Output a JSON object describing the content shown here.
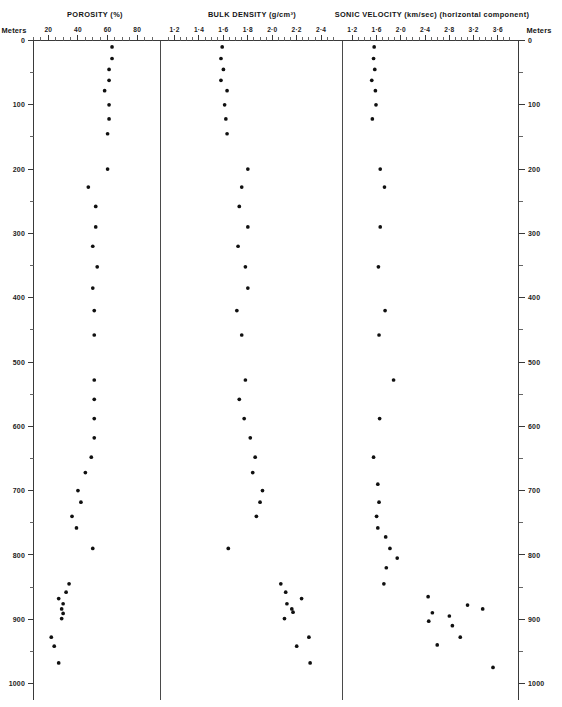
{
  "figure": {
    "width": 562,
    "height": 707,
    "background": "#ffffff",
    "point_color": "#101010",
    "axis_color": "#3a3a3a"
  },
  "depth_axis": {
    "name_left": "Meters",
    "name_right": "Meters",
    "min": 0,
    "max": 1000,
    "major_step": 100,
    "minor_step": 50,
    "labels": [
      "0",
      "100",
      "200",
      "300",
      "400",
      "500",
      "600",
      "700",
      "800",
      "900",
      "1000"
    ]
  },
  "panels": [
    {
      "key": "porosity",
      "title": "POROSITY",
      "units": "(%)",
      "xmin": 10,
      "xmax": 92,
      "tick_step": 5,
      "labeled_ticks": [
        {
          "value": 20,
          "label": "20"
        },
        {
          "value": 40,
          "label": "40"
        },
        {
          "value": 60,
          "label": "60"
        },
        {
          "value": 80,
          "label": "80"
        }
      ]
    },
    {
      "key": "bulk_density",
      "title": "BULK DENSITY",
      "units": "(g/cm³)",
      "xmin": 1.13,
      "xmax": 2.53,
      "tick_step": 0.05,
      "labeled_ticks": [
        {
          "value": 1.2,
          "label": "1·2"
        },
        {
          "value": 1.4,
          "label": "1·4"
        },
        {
          "value": 1.6,
          "label": "1·6"
        },
        {
          "value": 1.8,
          "label": "1·8"
        },
        {
          "value": 2.0,
          "label": "2·0"
        },
        {
          "value": 2.2,
          "label": "2·2"
        },
        {
          "value": 2.4,
          "label": "2·4"
        }
      ]
    },
    {
      "key": "sonic_velocity",
      "title": "SONIC VELOCITY",
      "units": "(km/sec)",
      "note": "(horizontal  component)",
      "xmin": 1.12,
      "xmax": 3.85,
      "tick_step": 0.1,
      "labeled_ticks": [
        {
          "value": 1.2,
          "label": "1·2"
        },
        {
          "value": 1.6,
          "label": "1·6"
        },
        {
          "value": 2.0,
          "label": "2·0"
        },
        {
          "value": 2.4,
          "label": "2·4"
        },
        {
          "value": 2.8,
          "label": "2·8"
        },
        {
          "value": 3.2,
          "label": "3·2"
        },
        {
          "value": 3.6,
          "label": "3·6"
        }
      ]
    }
  ],
  "chart_data": {
    "type": "scatter",
    "ylabel": "Meters",
    "ylim": [
      0,
      1000
    ],
    "y_inverted": true,
    "grid": false,
    "legend": "none",
    "panels": [
      {
        "name": "POROSITY (%)",
        "xlabel": "POROSITY (%)",
        "xlim": [
          10,
          92
        ],
        "xticks": [
          20,
          40,
          60,
          80
        ],
        "points": [
          {
            "depth": 10,
            "value": 63
          },
          {
            "depth": 28,
            "value": 63
          },
          {
            "depth": 45,
            "value": 61
          },
          {
            "depth": 62,
            "value": 61
          },
          {
            "depth": 78,
            "value": 58
          },
          {
            "depth": 100,
            "value": 61
          },
          {
            "depth": 122,
            "value": 61
          },
          {
            "depth": 145,
            "value": 60
          },
          {
            "depth": 200,
            "value": 60
          },
          {
            "depth": 228,
            "value": 47
          },
          {
            "depth": 258,
            "value": 52
          },
          {
            "depth": 290,
            "value": 52
          },
          {
            "depth": 320,
            "value": 50
          },
          {
            "depth": 352,
            "value": 53
          },
          {
            "depth": 385,
            "value": 50
          },
          {
            "depth": 420,
            "value": 51
          },
          {
            "depth": 458,
            "value": 51
          },
          {
            "depth": 528,
            "value": 51
          },
          {
            "depth": 558,
            "value": 51
          },
          {
            "depth": 588,
            "value": 51
          },
          {
            "depth": 618,
            "value": 51
          },
          {
            "depth": 648,
            "value": 49
          },
          {
            "depth": 672,
            "value": 45
          },
          {
            "depth": 700,
            "value": 40
          },
          {
            "depth": 718,
            "value": 42
          },
          {
            "depth": 740,
            "value": 36
          },
          {
            "depth": 758,
            "value": 39
          },
          {
            "depth": 790,
            "value": 50
          },
          {
            "depth": 845,
            "value": 34
          },
          {
            "depth": 858,
            "value": 32
          },
          {
            "depth": 868,
            "value": 27
          },
          {
            "depth": 876,
            "value": 30
          },
          {
            "depth": 884,
            "value": 29
          },
          {
            "depth": 891,
            "value": 30
          },
          {
            "depth": 899,
            "value": 29
          },
          {
            "depth": 928,
            "value": 22
          },
          {
            "depth": 942,
            "value": 24
          },
          {
            "depth": 968,
            "value": 27
          }
        ]
      },
      {
        "name": "BULK DENSITY (g/cm3)",
        "xlabel": "BULK DENSITY (g/cm³)",
        "xlim": [
          1.13,
          2.53
        ],
        "xticks": [
          1.2,
          1.4,
          1.6,
          1.8,
          2.0,
          2.2,
          2.4
        ],
        "points": [
          {
            "depth": 10,
            "value": 1.59
          },
          {
            "depth": 28,
            "value": 1.58
          },
          {
            "depth": 45,
            "value": 1.6
          },
          {
            "depth": 62,
            "value": 1.58
          },
          {
            "depth": 78,
            "value": 1.63
          },
          {
            "depth": 100,
            "value": 1.61
          },
          {
            "depth": 122,
            "value": 1.62
          },
          {
            "depth": 145,
            "value": 1.63
          },
          {
            "depth": 200,
            "value": 1.8
          },
          {
            "depth": 228,
            "value": 1.75
          },
          {
            "depth": 258,
            "value": 1.73
          },
          {
            "depth": 290,
            "value": 1.8
          },
          {
            "depth": 320,
            "value": 1.72
          },
          {
            "depth": 352,
            "value": 1.78
          },
          {
            "depth": 385,
            "value": 1.8
          },
          {
            "depth": 420,
            "value": 1.71
          },
          {
            "depth": 458,
            "value": 1.75
          },
          {
            "depth": 528,
            "value": 1.78
          },
          {
            "depth": 558,
            "value": 1.73
          },
          {
            "depth": 588,
            "value": 1.77
          },
          {
            "depth": 618,
            "value": 1.82
          },
          {
            "depth": 648,
            "value": 1.86
          },
          {
            "depth": 672,
            "value": 1.84
          },
          {
            "depth": 700,
            "value": 1.92
          },
          {
            "depth": 718,
            "value": 1.9
          },
          {
            "depth": 740,
            "value": 1.87
          },
          {
            "depth": 790,
            "value": 1.64
          },
          {
            "depth": 845,
            "value": 2.07
          },
          {
            "depth": 858,
            "value": 2.11
          },
          {
            "depth": 868,
            "value": 2.24
          },
          {
            "depth": 876,
            "value": 2.12
          },
          {
            "depth": 884,
            "value": 2.16
          },
          {
            "depth": 889,
            "value": 2.17
          },
          {
            "depth": 899,
            "value": 2.1
          },
          {
            "depth": 928,
            "value": 2.3
          },
          {
            "depth": 942,
            "value": 2.2
          },
          {
            "depth": 968,
            "value": 2.31
          }
        ]
      },
      {
        "name": "SONIC VELOCITY (km/sec)",
        "xlabel": "SONIC VELOCITY (km/sec) (horizontal component)",
        "xlim": [
          1.12,
          3.85
        ],
        "xticks": [
          1.2,
          1.6,
          2.0,
          2.4,
          2.8,
          3.2,
          3.6
        ],
        "points": [
          {
            "depth": 10,
            "value": 1.56
          },
          {
            "depth": 28,
            "value": 1.55
          },
          {
            "depth": 45,
            "value": 1.57
          },
          {
            "depth": 62,
            "value": 1.52
          },
          {
            "depth": 78,
            "value": 1.58
          },
          {
            "depth": 100,
            "value": 1.59
          },
          {
            "depth": 122,
            "value": 1.53
          },
          {
            "depth": 200,
            "value": 1.66
          },
          {
            "depth": 228,
            "value": 1.73
          },
          {
            "depth": 290,
            "value": 1.66
          },
          {
            "depth": 352,
            "value": 1.63
          },
          {
            "depth": 420,
            "value": 1.74
          },
          {
            "depth": 458,
            "value": 1.64
          },
          {
            "depth": 528,
            "value": 1.88
          },
          {
            "depth": 588,
            "value": 1.65
          },
          {
            "depth": 648,
            "value": 1.55
          },
          {
            "depth": 690,
            "value": 1.62
          },
          {
            "depth": 718,
            "value": 1.64
          },
          {
            "depth": 740,
            "value": 1.6
          },
          {
            "depth": 758,
            "value": 1.62
          },
          {
            "depth": 772,
            "value": 1.75
          },
          {
            "depth": 790,
            "value": 1.82
          },
          {
            "depth": 805,
            "value": 1.94
          },
          {
            "depth": 820,
            "value": 1.76
          },
          {
            "depth": 845,
            "value": 1.72
          },
          {
            "depth": 865,
            "value": 2.45
          },
          {
            "depth": 878,
            "value": 3.1
          },
          {
            "depth": 884,
            "value": 3.35
          },
          {
            "depth": 890,
            "value": 2.52
          },
          {
            "depth": 895,
            "value": 2.8
          },
          {
            "depth": 903,
            "value": 2.46
          },
          {
            "depth": 910,
            "value": 2.85
          },
          {
            "depth": 928,
            "value": 2.98
          },
          {
            "depth": 940,
            "value": 2.6
          },
          {
            "depth": 975,
            "value": 3.52
          }
        ]
      }
    ]
  }
}
